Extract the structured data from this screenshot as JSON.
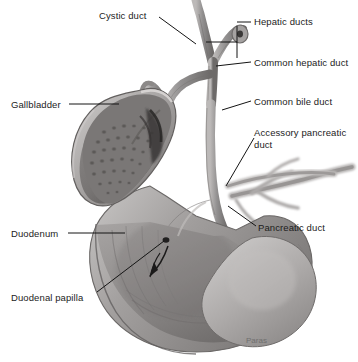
{
  "figure": {
    "background_color": "#ffffff",
    "text_color": "#1c1c1c",
    "signature": "Paras"
  },
  "labels": [
    {
      "id": "cystic-duct",
      "text": "Cystic duct",
      "x": 99,
      "y": 10,
      "leader": "diagonal-down-right"
    },
    {
      "id": "hepatic-ducts",
      "text": "Hepatic ducts",
      "x": 254,
      "y": 16,
      "leader": "bracket-left"
    },
    {
      "id": "common-hepatic-duct",
      "text": "Common hepatic duct",
      "x": 254,
      "y": 57,
      "leader": "horizontal-left"
    },
    {
      "id": "common-bile-duct",
      "text": "Common bile duct",
      "x": 254,
      "y": 96,
      "leader": "horizontal-left"
    },
    {
      "id": "accessory-pancreatic-duct",
      "text": "Accessory pancreatic duct",
      "x": 254,
      "y": 127,
      "leader": "diagonal-down-left"
    },
    {
      "id": "pancreatic-duct",
      "text": "Pancreatic duct",
      "x": 258,
      "y": 222,
      "leader": "diagonal-up-left"
    },
    {
      "id": "gallbladder",
      "text": "Gallbladder",
      "x": 11,
      "y": 99,
      "leader": "horizontal-right"
    },
    {
      "id": "duodenum",
      "text": "Duodenum",
      "x": 11,
      "y": 228,
      "leader": "horizontal-right"
    },
    {
      "id": "duodenal-papilla",
      "text": "Duodenal papilla",
      "x": 11,
      "y": 292,
      "leader": "diagonal-up-right"
    }
  ],
  "structures": [
    {
      "id": "gallbladder-body",
      "name": "Gallbladder (cut open)"
    },
    {
      "id": "cystic-duct-tube",
      "name": "Cystic duct"
    },
    {
      "id": "right-hepatic-duct",
      "name": "Right hepatic duct"
    },
    {
      "id": "left-hepatic-duct",
      "name": "Left hepatic duct"
    },
    {
      "id": "common-hepatic-duct-tube",
      "name": "Common hepatic duct"
    },
    {
      "id": "common-bile-duct-tube",
      "name": "Common bile duct"
    },
    {
      "id": "accessory-pancreatic-duct-tube",
      "name": "Accessory pancreatic duct"
    },
    {
      "id": "pancreatic-duct-tube",
      "name": "Pancreatic duct"
    },
    {
      "id": "duodenum-body",
      "name": "Duodenum (cut open)"
    },
    {
      "id": "duodenal-papilla-point",
      "name": "Duodenal papilla"
    },
    {
      "id": "flow-arrow",
      "name": "Bile flow arrow"
    }
  ],
  "palette": {
    "tissue_light": "#d5d3d2",
    "tissue_mid": "#a8a5a4",
    "tissue_dark": "#6e6b6a",
    "tissue_darkest": "#3e3c3b",
    "mucosa": "#8d8a89",
    "outline": "#5a5857",
    "leader_line": "#141414"
  }
}
